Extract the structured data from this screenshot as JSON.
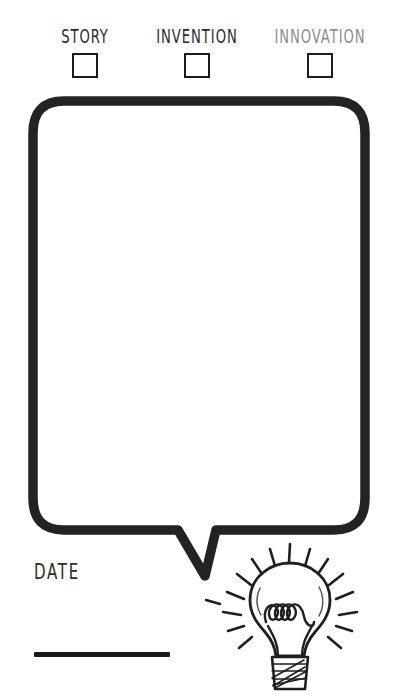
{
  "page": {
    "background_color": "#ffffff",
    "ink_color": "#1a1a1a",
    "muted_ink_color": "#8d8d8d"
  },
  "categories": [
    {
      "label": "STORY",
      "checked": false,
      "color": "#2b2b2b",
      "checkbox_name": "checkbox-story"
    },
    {
      "label": "INVENTION",
      "checked": false,
      "color": "#2b2b2b",
      "checkbox_name": "checkbox-invention"
    },
    {
      "label": "INNOVATION",
      "checked": false,
      "color": "#8d8d8d",
      "checkbox_name": "checkbox-innovation"
    }
  ],
  "bubble": {
    "placeholder": "",
    "value": "",
    "border_color": "#232323",
    "fill_color": "#ffffff"
  },
  "date_field": {
    "label": "DATE",
    "value": "",
    "line_color": "#1a1a1a"
  },
  "illustration": {
    "name": "lightbulb-icon",
    "description": "hand-drawn lightbulb with coiled filament, hatched screw base and radiating light rays",
    "stroke_color": "#1f1f1f"
  }
}
